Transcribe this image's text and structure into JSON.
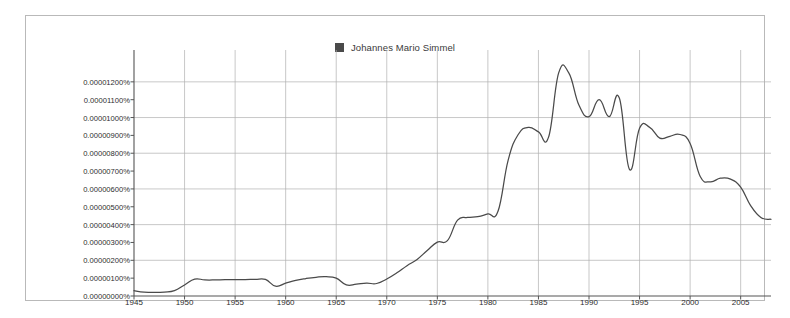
{
  "chart_data": {
    "type": "line",
    "title": "",
    "subtitle": "",
    "xlabel": "",
    "ylabel": "",
    "grid": true,
    "legend_position": "top-center",
    "legend": [
      "Johannes Mario Simmel"
    ],
    "series_color": "#4a4a4a",
    "legend_marker_color": "#4a4a4a",
    "xlim": [
      1945,
      2008
    ],
    "ylim": [
      0.0,
      1.3e-05
    ],
    "ytick_step": 1e-06,
    "xticks": [
      1945,
      1950,
      1955,
      1960,
      1965,
      1970,
      1975,
      1980,
      1985,
      1990,
      1995,
      2000,
      2005
    ],
    "xtick_labels": [
      "1945",
      "1950",
      "1955",
      "1960",
      "1965",
      "1970",
      "1975",
      "1980",
      "1985",
      "1990",
      "1995",
      "2000",
      "2005"
    ],
    "yticks": [
      0.0,
      1e-06,
      2e-06,
      3e-06,
      4e-06,
      5e-06,
      6e-06,
      7e-06,
      8e-06,
      9e-06,
      1e-05,
      1.1e-05,
      1.2e-05
    ],
    "ytick_labels": [
      "0.00000000%",
      "0.00000100%",
      "0.00000200%",
      "0.00000300%",
      "0.00000400%",
      "0.00000500%",
      "0.00000600%",
      "0.00000700%",
      "0.00000800%",
      "0.00000900%",
      "0.00001000%",
      "0.00001100%",
      "0.00001200%"
    ],
    "gridline_y_values": [
      2e-06,
      4e-06,
      6e-06,
      8e-06,
      1e-05,
      1.2e-05
    ],
    "gridline_x_values": [
      1950,
      1955,
      1960,
      1965,
      1970,
      1975,
      1980,
      1985,
      1990,
      1995,
      2000,
      2005
    ],
    "series": [
      {
        "name": "Johannes Mario Simmel",
        "x": [
          1945,
          1946,
          1947,
          1948,
          1949,
          1950,
          1951,
          1952,
          1953,
          1954,
          1955,
          1956,
          1957,
          1958,
          1959,
          1960,
          1961,
          1962,
          1963,
          1964,
          1965,
          1966,
          1967,
          1968,
          1969,
          1970,
          1971,
          1972,
          1973,
          1974,
          1975,
          1976,
          1977,
          1978,
          1979,
          1980,
          1981,
          1982,
          1983,
          1984,
          1985,
          1986,
          1987,
          1988,
          1989,
          1990,
          1991,
          1992,
          1993,
          1994,
          1995,
          1996,
          1997,
          1998,
          1999,
          2000,
          2001,
          2002,
          2003,
          2004,
          2005,
          2006,
          2007,
          2008
        ],
        "values": [
          3e-07,
          2.2e-07,
          2e-07,
          2.2e-07,
          3e-07,
          6.2e-07,
          9.5e-07,
          9e-07,
          9e-07,
          9.2e-07,
          9.2e-07,
          9.2e-07,
          9.3e-07,
          9.3e-07,
          5.5e-07,
          7.2e-07,
          8.8e-07,
          9.8e-07,
          1.05e-06,
          1.08e-06,
          1e-06,
          6.2e-07,
          6.6e-07,
          7.2e-07,
          7e-07,
          9.5e-07,
          1.3e-06,
          1.7e-06,
          2.05e-06,
          2.55e-06,
          3.02e-06,
          3.1e-06,
          4.25e-06,
          4.4e-06,
          4.45e-06,
          4.6e-06,
          4.75e-06,
          7.6e-06,
          9.05e-06,
          9.45e-06,
          9.2e-06,
          8.9e-06,
          1.25e-05,
          1.25e-05,
          1.07e-05,
          1.005e-05,
          1.1e-05,
          1.005e-05,
          1.11e-05,
          7.1e-06,
          9.4e-06,
          9.45e-06,
          8.85e-06,
          8.95e-06,
          9.05e-06,
          8.55e-06,
          6.7e-06,
          6.4e-06,
          6.6e-06,
          6.55e-06,
          6.1e-06,
          5.05e-06,
          4.4e-06,
          4.3e-06
        ],
        "note": "ngram relative frequency"
      }
    ]
  }
}
